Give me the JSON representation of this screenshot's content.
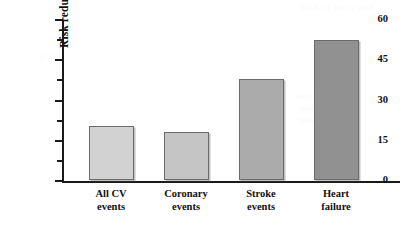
{
  "chart_data": {
    "type": "bar",
    "title": "",
    "xlabel": "",
    "ylabel": "Risk reduction (%)",
    "categories": [
      "All CV events",
      "Coronary events",
      "Stroke events",
      "Heart failure"
    ],
    "category_lines": [
      [
        "All CV",
        "events"
      ],
      [
        "Coronary",
        "events"
      ],
      [
        "Stroke",
        "events"
      ],
      [
        "Heart",
        "failure"
      ]
    ],
    "values": [
      20,
      18,
      37.5,
      52
    ],
    "ylim": [
      0,
      60
    ],
    "y_ticks_major": [
      0,
      15,
      30,
      45,
      60
    ],
    "y_tick_labels": [
      "0",
      "15",
      "30",
      "45",
      "60"
    ],
    "y_ticks_minor": [
      7.5,
      22.5,
      37.5,
      52.5
    ],
    "grid": false,
    "legend": false,
    "legend_position": "none",
    "bar_colors": [
      "#d2d2d2",
      "#c5c5c5",
      "#ababab",
      "#919191"
    ],
    "bar_border_color": "#6b6b6b",
    "axis_color": "#1a1a1a",
    "background_color": "#ffffff",
    "bar_width_px": 45,
    "bar_centers_px": [
      111,
      186,
      261,
      336
    ]
  },
  "bleed_through": {
    "line1": "Risk of its ss and",
    "line2": "seen in the",
    "line3": "and heart",
    "line4": "failure",
    "line5": "is level"
  }
}
